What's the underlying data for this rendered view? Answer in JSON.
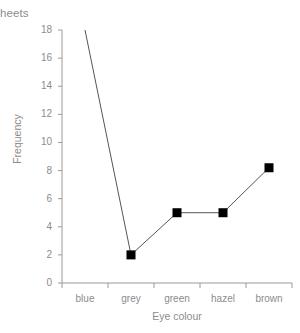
{
  "page": {
    "cropped_text_fragment": "heets"
  },
  "chart_data": {
    "type": "line",
    "title": "",
    "subtitle": "",
    "xlabel": "Eye colour",
    "ylabel": "Frequency",
    "categories": [
      "blue",
      "grey",
      "green",
      "hazel",
      "brown"
    ],
    "values": [
      18,
      2,
      5,
      5,
      8.2
    ],
    "series": [
      {
        "name": "Frequency",
        "values": [
          18,
          2,
          5,
          5,
          8.2
        ],
        "line_color": "#555555",
        "marker": "square",
        "marker_color": "#000000",
        "markers_shown": [
          false,
          true,
          true,
          true,
          true
        ]
      }
    ],
    "ylim": [
      0,
      18
    ],
    "yticks": [
      0,
      2,
      4,
      6,
      8,
      10,
      12,
      14,
      16,
      18
    ],
    "ytick_labels": [
      "0",
      "2",
      "4",
      "6",
      "8",
      "10",
      "12",
      "14",
      "16",
      "18"
    ],
    "xtick_labels": [
      "blue",
      "grey",
      "green",
      "hazel",
      "brown"
    ],
    "grid": false,
    "legend": false,
    "legend_position": "none",
    "axis_color": "#9a9a9a",
    "text_color": "#8c8c8c",
    "background": "#ffffff"
  }
}
